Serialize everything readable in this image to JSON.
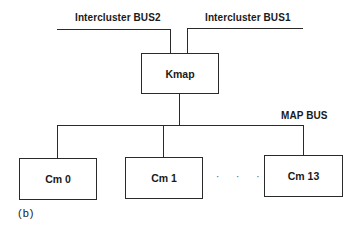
{
  "diagram": {
    "caption": "(b)",
    "buses": {
      "intercluster_bus2": "Intercluster BUS2",
      "intercluster_bus1": "Intercluster BUS1",
      "map_bus": "MAP BUS"
    },
    "kmap": {
      "label": "Kmap"
    },
    "modules": [
      {
        "label": "Cm 0"
      },
      {
        "label": "Cm 1"
      },
      {
        "label": "Cm 13"
      }
    ],
    "ellipsis": "· · ·"
  }
}
